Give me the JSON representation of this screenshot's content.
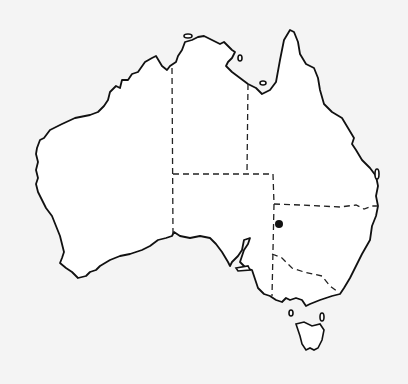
{
  "map": {
    "subject": "Australia",
    "style": "black-and-white outline map with dashed state borders",
    "background_color": "#f4f4f4",
    "land_color": "#ffffff",
    "outline_color": "#111111",
    "marker": {
      "label": "location marker",
      "x": 279,
      "y": 224,
      "color": "#111111",
      "region": "western New South Wales"
    },
    "regions": [
      "Western Australia",
      "Northern Territory",
      "South Australia",
      "Queensland",
      "New South Wales",
      "Victoria",
      "Tasmania"
    ]
  }
}
